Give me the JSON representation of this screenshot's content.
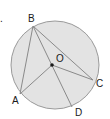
{
  "diagram": {
    "type": "circle-geometry",
    "problem_marker": ".",
    "circle": {
      "cx": 55,
      "cy": 65,
      "r": 44,
      "fill": "#e3e3e3",
      "stroke": "#9a9a9a"
    },
    "center": {
      "label": "O",
      "x": 52,
      "y": 65
    },
    "points": {
      "B": {
        "label": "B",
        "x": 33,
        "y": 26
      },
      "C": {
        "label": "C",
        "x": 93,
        "y": 80
      },
      "A": {
        "label": "A",
        "x": 20,
        "y": 94
      },
      "D": {
        "label": "D",
        "x": 72,
        "y": 107
      }
    },
    "segments": [
      "BA",
      "BD",
      "BC",
      "OA",
      "OC",
      "BO"
    ],
    "line_color": "#8a8a8a"
  }
}
